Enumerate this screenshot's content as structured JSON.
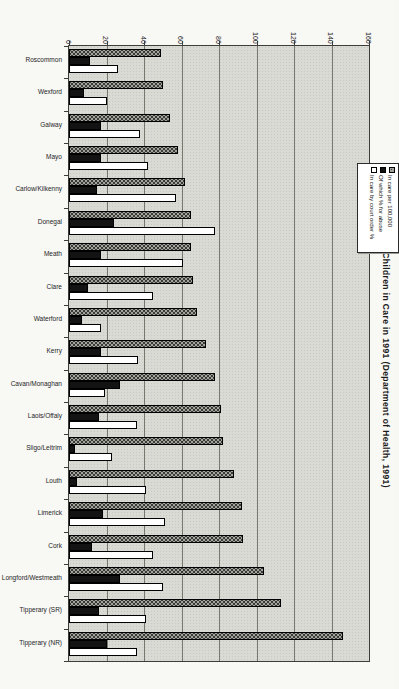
{
  "chart_data": {
    "type": "bar",
    "title": "Figure 3.1: Children in Care in 1991 (Department of Health, 1991)",
    "orientation": "landscape column chart rotated 90° clockwise on a portrait page; bars run left-to-right, value axis along top with rotated tick labels",
    "categories": [
      "Roscommon",
      "Wexford",
      "Galway",
      "Mayo",
      "Carlow/Kilkenny",
      "Donegal",
      "Meath",
      "Clare",
      "Waterford",
      "Kerry",
      "Cavan/Monaghan",
      "Laois/Offaly",
      "Sligo/Leitrim",
      "Louth",
      "Limerick",
      "Cork",
      "Longford/Westmeath",
      "Tipperary (SR)",
      "Tipperary (NR)"
    ],
    "series": [
      {
        "name": "In care per 100,000",
        "swatch": "gray-hatched",
        "values": [
          49,
          50,
          54,
          58,
          62,
          65,
          65,
          66,
          68,
          73,
          78,
          81,
          82,
          88,
          92,
          93,
          104,
          113,
          146
        ]
      },
      {
        "name": "Of which % for abuse",
        "swatch": "black",
        "values": [
          11,
          8,
          17,
          17,
          15,
          24,
          17,
          10,
          7,
          17,
          27,
          16,
          3,
          4,
          18,
          12,
          27,
          16,
          20
        ]
      },
      {
        "name": "In care by court order %",
        "swatch": "white",
        "values": [
          26,
          20,
          38,
          42,
          57,
          78,
          61,
          45,
          17,
          37,
          19,
          36,
          23,
          41,
          51,
          45,
          50,
          41,
          36
        ]
      }
    ],
    "value_axis": {
      "min": 0,
      "max": 160,
      "tick_step": 20,
      "tick_labels": [
        "0",
        "20",
        "40",
        "60",
        "80",
        "100",
        "120",
        "140",
        "160"
      ]
    },
    "grid": true,
    "legend_position": "inside plot, upper right area (box rotated with page)",
    "colors": {
      "bar_gray": "#a3a39d",
      "bar_black": "#131313",
      "bar_white": "#ffffff",
      "plot_bg": "#dadad5",
      "grid": "#78786f"
    }
  }
}
